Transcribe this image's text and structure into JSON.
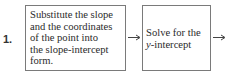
{
  "step": {
    "number": "1."
  },
  "boxes": [
    {
      "lines": [
        "Substitute the slope",
        "and the coordinates",
        "of the point into",
        "the slope-intercept",
        "form."
      ]
    },
    {
      "lines": [
        "Solve for the",
        "-intercept"
      ],
      "italic_prefix": "y"
    }
  ],
  "colors": {
    "border": "#7a7a7a",
    "text": "#2b2b2b",
    "arrow": "#444444"
  }
}
